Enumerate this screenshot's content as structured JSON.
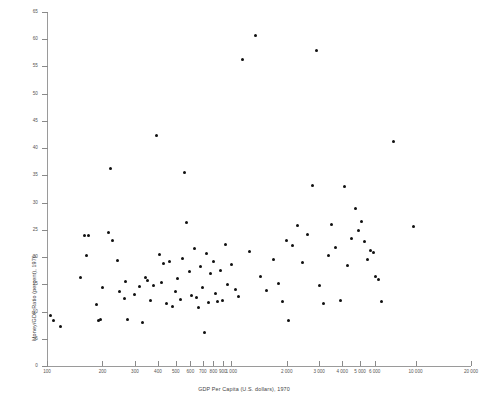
{
  "chart_data": {
    "type": "scatter",
    "title": "",
    "xlabel": "GDP Per Capita (U.S. dollars), 1970",
    "ylabel": "Money/GDP Ratio (percent), 1970",
    "xscale": "log",
    "yscale": "linear",
    "xlim": [
      100,
      20000
    ],
    "ylim": [
      0,
      65
    ],
    "grid": false,
    "legend": null,
    "xticks": [
      100,
      200,
      300,
      400,
      500,
      600,
      700,
      800,
      900,
      1000,
      2000,
      3000,
      4000,
      5000,
      6000,
      10000,
      20000
    ],
    "xtick_labels": [
      "100",
      "200",
      "300",
      "400",
      "500",
      "600",
      "700",
      "800",
      "900",
      "1 000",
      "2 000",
      "3 000",
      "4 000",
      "5 000",
      "6 000",
      "10 000",
      "20 000"
    ],
    "yticks": [
      0,
      5,
      10,
      15,
      20,
      25,
      30,
      35,
      40,
      45,
      50,
      55,
      60,
      65
    ],
    "ytick_labels": [
      "0",
      "5",
      "10",
      "15",
      "20",
      "25",
      "30",
      "35",
      "40",
      "45",
      "50",
      "55",
      "60",
      "65"
    ],
    "marker": {
      "shape": "circle",
      "color": "#101010",
      "size": 3
    },
    "points": [
      [
        105,
        9.2
      ],
      [
        108,
        8.4
      ],
      [
        118,
        7.3
      ],
      [
        152,
        16.3
      ],
      [
        160,
        24.0
      ],
      [
        163,
        20.3
      ],
      [
        168,
        23.9
      ],
      [
        185,
        11.3
      ],
      [
        190,
        8.3
      ],
      [
        196,
        8.6
      ],
      [
        200,
        14.5
      ],
      [
        215,
        24.6
      ],
      [
        222,
        36.2
      ],
      [
        228,
        23.1
      ],
      [
        240,
        19.4
      ],
      [
        247,
        13.6
      ],
      [
        262,
        12.4
      ],
      [
        268,
        15.5
      ],
      [
        272,
        8.5
      ],
      [
        300,
        13.2
      ],
      [
        318,
        14.6
      ],
      [
        330,
        7.9
      ],
      [
        342,
        16.2
      ],
      [
        352,
        15.7
      ],
      [
        365,
        12.0
      ],
      [
        380,
        14.8
      ],
      [
        395,
        42.3
      ],
      [
        408,
        20.5
      ],
      [
        418,
        15.3
      ],
      [
        430,
        18.9
      ],
      [
        445,
        11.4
      ],
      [
        462,
        19.2
      ],
      [
        480,
        10.9
      ],
      [
        498,
        13.7
      ],
      [
        512,
        16.1
      ],
      [
        528,
        12.2
      ],
      [
        545,
        19.8
      ],
      [
        560,
        35.6
      ],
      [
        575,
        26.3
      ],
      [
        590,
        17.4
      ],
      [
        610,
        13.0
      ],
      [
        628,
        21.5
      ],
      [
        645,
        12.6
      ],
      [
        660,
        10.8
      ],
      [
        680,
        18.2
      ],
      [
        700,
        14.4
      ],
      [
        715,
        6.2
      ],
      [
        735,
        20.6
      ],
      [
        755,
        11.6
      ],
      [
        775,
        16.9
      ],
      [
        800,
        19.1
      ],
      [
        820,
        13.4
      ],
      [
        845,
        11.8
      ],
      [
        870,
        17.6
      ],
      [
        900,
        12.1
      ],
      [
        930,
        22.4
      ],
      [
        960,
        15.0
      ],
      [
        1000,
        18.6
      ],
      [
        1050,
        14.1
      ],
      [
        1100,
        12.7
      ],
      [
        1150,
        56.2
      ],
      [
        1250,
        21.0
      ],
      [
        1350,
        60.6
      ],
      [
        1450,
        16.4
      ],
      [
        1550,
        13.8
      ],
      [
        1700,
        19.6
      ],
      [
        1800,
        15.2
      ],
      [
        1900,
        11.9
      ],
      [
        2000,
        23.0
      ],
      [
        2050,
        8.4
      ],
      [
        2150,
        22.1
      ],
      [
        2300,
        25.8
      ],
      [
        2450,
        19.0
      ],
      [
        2600,
        24.2
      ],
      [
        2750,
        33.2
      ],
      [
        2900,
        58.0
      ],
      [
        3000,
        14.8
      ],
      [
        3150,
        11.5
      ],
      [
        3350,
        20.3
      ],
      [
        3500,
        26.0
      ],
      [
        3700,
        21.7
      ],
      [
        3900,
        12.0
      ],
      [
        4100,
        33.0
      ],
      [
        4300,
        18.4
      ],
      [
        4500,
        23.4
      ],
      [
        4700,
        29.0
      ],
      [
        4900,
        24.9
      ],
      [
        5100,
        26.6
      ],
      [
        5300,
        22.8
      ],
      [
        5500,
        19.5
      ],
      [
        5700,
        21.2
      ],
      [
        5900,
        20.8
      ],
      [
        6100,
        16.4
      ],
      [
        6300,
        15.9
      ],
      [
        6500,
        11.9
      ],
      [
        7600,
        41.2
      ],
      [
        9700,
        25.6
      ]
    ]
  },
  "figure": {
    "background": "#ffffff",
    "axis_color": "#9a9a9a",
    "text_color": "#444444"
  }
}
